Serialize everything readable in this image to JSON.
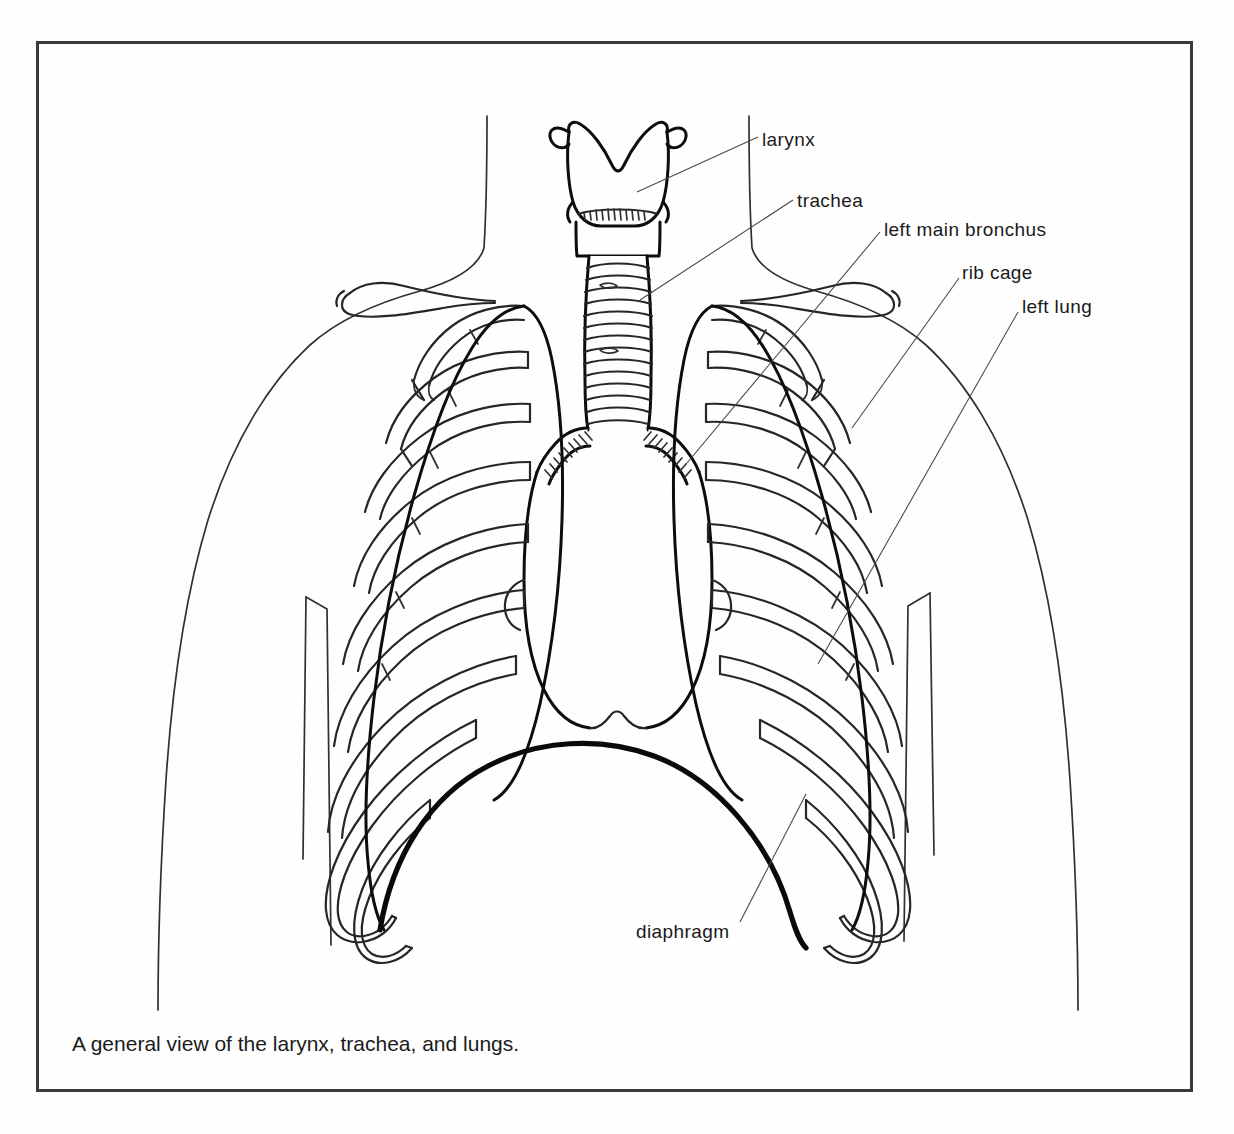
{
  "figure": {
    "caption": "A general view of the larynx, trachea, and lungs.",
    "style": {
      "background": "#fefefe",
      "frame_color": "#3a3a3a",
      "line_color": "#1f1f1f",
      "leader_color": "#555555",
      "emphasis_color": "#111111"
    },
    "labels": [
      {
        "key": "larynx",
        "text": "larynx"
      },
      {
        "key": "trachea",
        "text": "trachea"
      },
      {
        "key": "bronchus",
        "text": "left main bronchus"
      },
      {
        "key": "ribcage",
        "text": "rib cage"
      },
      {
        "key": "leftlung",
        "text": "left lung"
      },
      {
        "key": "diaphragm",
        "text": "diaphragm"
      }
    ],
    "structures": [
      "body-outline",
      "clavicle-left",
      "clavicle-right",
      "larynx-thyroid-cartilage",
      "trachea-rings",
      "left-main-bronchus",
      "right-main-bronchus",
      "rib-cage",
      "left-lung-outline",
      "right-lung-outline",
      "diaphragm-arc",
      "arm-outline-left",
      "arm-outline-right"
    ]
  }
}
